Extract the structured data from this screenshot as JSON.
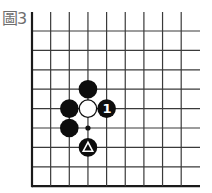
{
  "figure": {
    "label": "圖3",
    "board": {
      "origin_x": 32,
      "origin_y": 31,
      "dx": 18.65,
      "dy": 19.4,
      "cols": 9,
      "rows": 9,
      "top_open_to_y": 12,
      "right_open_to_x": 200,
      "left_edge": true,
      "bottom_edge": true,
      "line_color": "#3a3a3a",
      "edge_color": "#1a1a1a"
    },
    "stones": [
      {
        "color": "black",
        "col": 3,
        "row": 3,
        "mark": ""
      },
      {
        "color": "black",
        "col": 2,
        "row": 4,
        "mark": ""
      },
      {
        "color": "white",
        "col": 3,
        "row": 4,
        "mark": ""
      },
      {
        "color": "black",
        "col": 4,
        "row": 4,
        "mark": "1"
      },
      {
        "color": "black",
        "col": 2,
        "row": 5,
        "mark": ""
      },
      {
        "color": "black",
        "col": 3,
        "row": 6,
        "mark": "triangle"
      }
    ],
    "points": [
      {
        "type": "dot",
        "col": 3,
        "row": 5
      }
    ]
  }
}
